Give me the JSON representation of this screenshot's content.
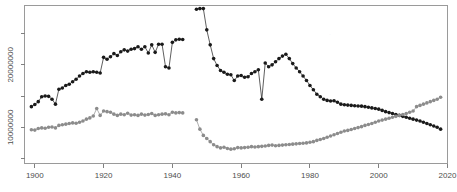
{
  "figure": {
    "background_color": "#ffffff",
    "frame_color": "#9a9a9a",
    "tick_color": "#808080",
    "label_color": "#4d4d4d"
  },
  "chart_data": {
    "type": "line",
    "title": "",
    "subtitle": "",
    "xlabel": "",
    "ylabel": "",
    "grid": false,
    "legend": "none",
    "xlim": [
      1897,
      2020
    ],
    "ylim": [
      4200000,
      29500000
    ],
    "xticks": [
      1900,
      1920,
      1940,
      1960,
      1980,
      2000,
      2020
    ],
    "xticklabels": [
      "1900",
      "1920",
      "1940",
      "1960",
      "1980",
      "2000",
      "2020"
    ],
    "yticks": [
      10000000,
      20000000
    ],
    "yticklabels": [
      "10000000",
      "20000000"
    ],
    "ytick_minor": [
      5000000,
      15000000,
      25000000
    ],
    "marker": "filled-circle",
    "marker_size": 2,
    "series": [
      {
        "name": "series-dark",
        "color": "#1a1a1a",
        "x": [
          1899,
          1900,
          1901,
          1902,
          1903,
          1904,
          1905,
          1906,
          1907,
          1908,
          1909,
          1910,
          1911,
          1912,
          1913,
          1914,
          1915,
          1916,
          1917,
          1918,
          1919,
          1920,
          1921,
          1922,
          1923,
          1924,
          1925,
          1926,
          1927,
          1928,
          1929,
          1930,
          1931,
          1932,
          1933,
          1934,
          1935,
          1936,
          1937,
          1938,
          1939,
          1940,
          1941,
          1942,
          1943,
          1947,
          1948,
          1949,
          1950,
          1951,
          1952,
          1953,
          1954,
          1955,
          1956,
          1957,
          1958,
          1959,
          1960,
          1961,
          1962,
          1963,
          1964,
          1965,
          1966,
          1967,
          1968,
          1969,
          1970,
          1971,
          1972,
          1973,
          1974,
          1975,
          1976,
          1977,
          1978,
          1979,
          1980,
          1981,
          1982,
          1983,
          1984,
          1985,
          1986,
          1987,
          1988,
          1989,
          1990,
          1991,
          1992,
          1993,
          1994,
          1995,
          1996,
          1997,
          1998,
          1999,
          2000,
          2001,
          2002,
          2003,
          2004,
          2005,
          2006,
          2007,
          2008,
          2009,
          2010,
          2011,
          2012,
          2013,
          2014,
          2015,
          2016,
          2017,
          2018
        ],
        "y": [
          13300000,
          13650000,
          14100000,
          14900000,
          15000000,
          14950000,
          14500000,
          13700000,
          16100000,
          16300000,
          16700000,
          16900000,
          17300000,
          17700000,
          18200000,
          18600000,
          18900000,
          18800000,
          18900000,
          18800000,
          18700000,
          21200000,
          20900000,
          21300000,
          21800000,
          21500000,
          22100000,
          22400000,
          22200000,
          22500000,
          22600000,
          22900000,
          22500000,
          22900000,
          21900000,
          23200000,
          22000000,
          23300000,
          23300000,
          19700000,
          19500000,
          23600000,
          24000000,
          24100000,
          24050000,
          28900000,
          29000000,
          29000000,
          25600000,
          23200000,
          21000000,
          19900000,
          19100000,
          18800000,
          18500000,
          18400000,
          17500000,
          18200000,
          18300000,
          18000000,
          18100000,
          18600000,
          18900000,
          19200000,
          14500000,
          20300000,
          19700000,
          20000000,
          20500000,
          21000000,
          21400000,
          21700000,
          21000000,
          20200000,
          19500000,
          18900000,
          18200000,
          17500000,
          16700000,
          16000000,
          15300000,
          14900000,
          14500000,
          14300000,
          14200000,
          14250000,
          14000000,
          13700000,
          13600000,
          13550000,
          13500000,
          13450000,
          13400000,
          13380000,
          13300000,
          13200000,
          13100000,
          13000000,
          12900000,
          12700000,
          12500000,
          12350000,
          12200000,
          12050000,
          11900000,
          11750000,
          11600000,
          11450000,
          11300000,
          11150000,
          11000000,
          10800000,
          10600000,
          10400000,
          10200000,
          10000000,
          9700000
        ]
      },
      {
        "name": "series-gray",
        "color": "#8c8c8c",
        "x": [
          1899,
          1900,
          1901,
          1902,
          1903,
          1904,
          1905,
          1906,
          1907,
          1908,
          1909,
          1910,
          1911,
          1912,
          1913,
          1914,
          1915,
          1916,
          1917,
          1918,
          1919,
          1920,
          1921,
          1922,
          1923,
          1924,
          1925,
          1926,
          1927,
          1928,
          1929,
          1930,
          1931,
          1932,
          1933,
          1934,
          1935,
          1936,
          1937,
          1938,
          1939,
          1940,
          1941,
          1942,
          1943,
          1947,
          1948,
          1949,
          1950,
          1951,
          1952,
          1953,
          1954,
          1955,
          1956,
          1957,
          1958,
          1959,
          1960,
          1961,
          1962,
          1963,
          1964,
          1965,
          1966,
          1967,
          1968,
          1969,
          1970,
          1971,
          1972,
          1973,
          1974,
          1975,
          1976,
          1977,
          1978,
          1979,
          1980,
          1981,
          1982,
          1983,
          1984,
          1985,
          1986,
          1987,
          1988,
          1989,
          1990,
          1991,
          1992,
          1993,
          1994,
          1995,
          1996,
          1997,
          1998,
          1999,
          2000,
          2001,
          2002,
          2003,
          2004,
          2005,
          2006,
          2007,
          2008,
          2009,
          2010,
          2011,
          2012,
          2013,
          2014,
          2015,
          2016,
          2017,
          2018
        ],
        "y": [
          9600000,
          9550000,
          9800000,
          9900000,
          9850000,
          10000000,
          10050000,
          9900000,
          10300000,
          10400000,
          10500000,
          10600000,
          10700000,
          10650000,
          10800000,
          11000000,
          11300000,
          11500000,
          11800000,
          13000000,
          11900000,
          12600000,
          12500000,
          12400000,
          12100000,
          11900000,
          12100000,
          12000000,
          12250000,
          11950000,
          12000000,
          11900000,
          12100000,
          11950000,
          12050000,
          12200000,
          11900000,
          12000000,
          12100000,
          12150000,
          12000000,
          12400000,
          12300000,
          12350000,
          12300000,
          11200000,
          9700000,
          8700000,
          8200000,
          7700000,
          7200000,
          6900000,
          6700000,
          6800000,
          6600000,
          6500000,
          6550000,
          6750000,
          6700000,
          6750000,
          6800000,
          6900000,
          6850000,
          6900000,
          6950000,
          7000000,
          7100000,
          7150000,
          7050000,
          7100000,
          7150000,
          7200000,
          7250000,
          7300000,
          7350000,
          7400000,
          7450000,
          7500000,
          7600000,
          7700000,
          7900000,
          8050000,
          8200000,
          8400000,
          8600000,
          8800000,
          9000000,
          9200000,
          9400000,
          9500000,
          9650000,
          9800000,
          9950000,
          10100000,
          10300000,
          10450000,
          10600000,
          10800000,
          11000000,
          11150000,
          11300000,
          11450000,
          11600000,
          11750000,
          11900000,
          12050000,
          12200000,
          12400000,
          12600000,
          13300000,
          13500000,
          13700000,
          13900000,
          14100000,
          14300000,
          14500000,
          14800000
        ]
      }
    ],
    "series_gaps": [
      {
        "after_year": 1943,
        "before_year": 1947
      }
    ]
  }
}
